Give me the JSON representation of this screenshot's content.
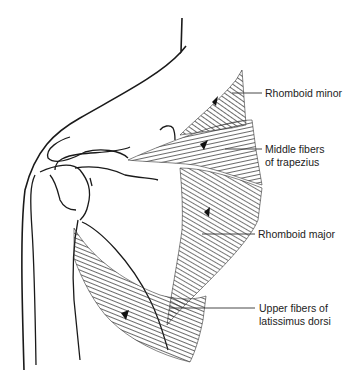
{
  "figure": {
    "labels": [
      {
        "id": "rhomboid-minor",
        "lines": [
          "Rhomboid minor"
        ]
      },
      {
        "id": "middle-trapezius",
        "lines": [
          "Middle fibers",
          "of trapezius"
        ]
      },
      {
        "id": "rhomboid-major",
        "lines": [
          "Rhomboid major"
        ]
      },
      {
        "id": "latissimus-dorsi",
        "lines": [
          "Upper fibers of",
          "latissimus dorsi"
        ]
      }
    ]
  },
  "colors": {
    "outline": "#1a1a1a",
    "muscle_fill": "#8a8a8a",
    "muscle_fiber": "#2a2a2a",
    "background": "#ffffff"
  }
}
